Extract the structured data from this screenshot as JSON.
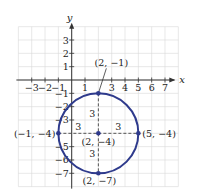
{
  "diagram": {
    "type": "circle-on-coordinate-plane",
    "axes": {
      "x_label": "x",
      "y_label": "y",
      "x_range": [
        -4,
        8
      ],
      "y_range": [
        -8,
        4
      ],
      "x_ticks": [
        {
          "v": -3,
          "label": "−3"
        },
        {
          "v": -2,
          "label": "−2"
        },
        {
          "v": -1,
          "label": "−1"
        },
        {
          "v": 1,
          "label": "1"
        },
        {
          "v": 3,
          "label": "3"
        },
        {
          "v": 4,
          "label": "4"
        },
        {
          "v": 5,
          "label": "5"
        },
        {
          "v": 6,
          "label": "6"
        },
        {
          "v": 7,
          "label": "7"
        }
      ],
      "y_ticks": [
        {
          "v": 3,
          "label": "3"
        },
        {
          "v": 2,
          "label": "2"
        },
        {
          "v": 1,
          "label": "1"
        },
        {
          "v": -1,
          "label": "−1"
        },
        {
          "v": -2,
          "label": "−2"
        },
        {
          "v": -3,
          "label": "−3"
        },
        {
          "v": -5,
          "label": "−5"
        },
        {
          "v": -6,
          "label": "−6"
        },
        {
          "v": -7,
          "label": "−7"
        }
      ]
    },
    "circle": {
      "center": [
        2,
        -4
      ],
      "radius": 3,
      "color": "#2e3a8c"
    },
    "points": [
      {
        "name": "center",
        "x": 2,
        "y": -4,
        "label": "(2, −4)"
      },
      {
        "name": "top",
        "x": 2,
        "y": -1,
        "label": "(2, −1)"
      },
      {
        "name": "bottom",
        "x": 2,
        "y": -7,
        "label": "(2, −7)"
      },
      {
        "name": "left",
        "x": -1,
        "y": -4,
        "label": "(−1, −4)"
      },
      {
        "name": "right",
        "x": 5,
        "y": -4,
        "label": "(5, −4)"
      }
    ],
    "radius_labels": {
      "up": "3",
      "down": "3",
      "left": "3",
      "right": "3"
    },
    "colors": {
      "grid": "#d9d9d9",
      "axis": "#333333",
      "dashed": "#444444",
      "circle": "#2e3a8c"
    }
  }
}
